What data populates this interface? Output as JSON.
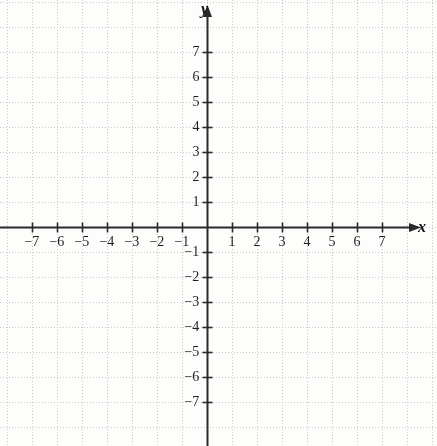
{
  "chart_data": {
    "type": "scatter",
    "title": "",
    "subtitle": "",
    "xlabel": "x",
    "ylabel": "y",
    "xlim": [
      -7.6,
      7.6
    ],
    "ylim": [
      -7.7,
      7.85
    ],
    "grid": true,
    "grid_style": "dotted",
    "legend": null,
    "series": [],
    "annotations": [],
    "x_ticks": [
      -7,
      -6,
      -5,
      -4,
      -3,
      -2,
      -1,
      1,
      2,
      3,
      4,
      5,
      6,
      7
    ],
    "y_ticks": [
      7,
      6,
      5,
      4,
      3,
      2,
      1,
      -1,
      -2,
      -3,
      -4,
      -5,
      -6,
      -7
    ],
    "x_tick_labels": [
      "−7",
      "−6",
      "−5",
      "−4",
      "−3",
      "−2",
      "−1",
      "1",
      "2",
      "3",
      "4",
      "5",
      "6",
      "7"
    ],
    "y_tick_labels": [
      "7",
      "6",
      "5",
      "4",
      "3",
      "2",
      "1",
      "−1",
      "−2",
      "−3",
      "−4",
      "−5",
      "−6",
      "−7"
    ],
    "origin_label": "",
    "tick_spacing_px": 25,
    "origin_px": {
      "x": 207,
      "y": 227
    },
    "arrows": {
      "x_positive": true,
      "y_positive": true,
      "x_negative": false,
      "y_negative": false
    }
  },
  "colors": {
    "background": "#fdfdfc",
    "grid": "#c9c9c9",
    "axis": "#2a2a2a",
    "tick_text": "#1d1d1d",
    "axis_label": "#161616"
  },
  "labels": {
    "x_axis_name": "x",
    "y_axis_name": "y"
  }
}
